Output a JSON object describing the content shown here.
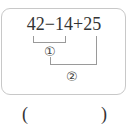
{
  "problem": {
    "expression": "42−14+25",
    "step1_marker": "①",
    "step2_marker": "②",
    "answer_open": "(",
    "answer_close": ")",
    "answer_value": ""
  }
}
